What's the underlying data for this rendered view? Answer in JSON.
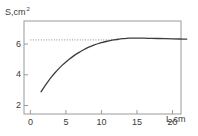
{
  "chart_data": {
    "type": "line",
    "title": "",
    "subtitle": "",
    "xlabel": "L,cm",
    "ylabel": "S,cm",
    "ylabel_exponent": "2",
    "xlabel_symbol": "L",
    "xlabel_unit": "cm",
    "ylabel_symbol": "S",
    "ylabel_unit": "cm",
    "grid": false,
    "legend": null,
    "legend_position": "none",
    "xlim": [
      -0.9,
      21.2
    ],
    "ylim": [
      1.45,
      7.5
    ],
    "xticks": [
      0,
      5,
      10,
      15,
      20
    ],
    "xtick_labels": [
      "0",
      "5",
      "10",
      "15",
      "20"
    ],
    "yticks": [
      2,
      4,
      6
    ],
    "ytick_labels": [
      "2",
      "4",
      "6"
    ],
    "series": [
      {
        "name": "S(L)",
        "color": "#3c3c3c",
        "style": "solid",
        "x": [
          1.5,
          2.0,
          2.5,
          3.0,
          3.5,
          4.0,
          4.5,
          5.0,
          5.5,
          6.0,
          6.5,
          7.0,
          7.5,
          8.0,
          8.5,
          9.0,
          9.5,
          10.0,
          10.5,
          11.0,
          11.5,
          12.0,
          12.5,
          13.0,
          13.5,
          14.0,
          15.0,
          16.0,
          17.0,
          18.0,
          19.0,
          20.0,
          21.0,
          22.0
        ],
        "y": [
          2.9,
          3.25,
          3.58,
          3.88,
          4.15,
          4.4,
          4.63,
          4.84,
          5.03,
          5.2,
          5.36,
          5.5,
          5.63,
          5.75,
          5.85,
          5.94,
          6.02,
          6.09,
          6.15,
          6.2,
          6.25,
          6.29,
          6.32,
          6.35,
          6.37,
          6.38,
          6.39,
          6.38,
          6.37,
          6.36,
          6.35,
          6.34,
          6.33,
          6.32
        ]
      }
    ],
    "annotations": [
      {
        "type": "hline",
        "name": "asymptote-dotted-line",
        "y": 6.27,
        "x_start": 0.0,
        "x_end": 12.4,
        "style": "dotted",
        "color": "#8c8c8c"
      }
    ],
    "frame": {
      "color": "#9a9a9a",
      "left": true,
      "right": true,
      "top": true,
      "bottom": true
    }
  }
}
